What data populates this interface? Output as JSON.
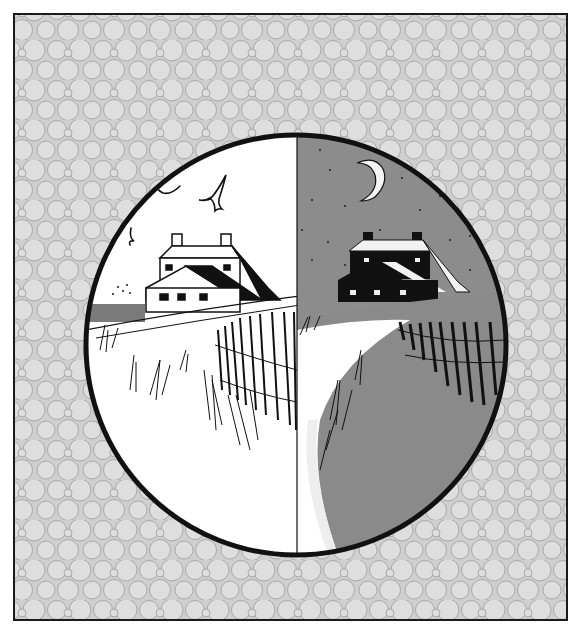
{
  "illustration": {
    "title": "Farmhouse by the dunes — day and night",
    "frame": {
      "x": 14,
      "y": 14,
      "width": 553,
      "height": 606,
      "border_color": "#1a1a1a"
    },
    "background_pattern": {
      "type": "packed-circles",
      "fill": "#dcdcdc",
      "stroke": "#a9a9a9"
    },
    "vignette": {
      "cx": 296,
      "cy": 345,
      "r": 210,
      "border_color": "#111111",
      "border_width": 5
    },
    "day_half": {
      "sky_color": "#ffffff",
      "elements": [
        "farmhouse",
        "three-birds",
        "grass-dunes",
        "sand-fence",
        "path"
      ]
    },
    "night_half": {
      "sky_color": "#8c8c8c",
      "elements": [
        "crescent-moon",
        "stars",
        "farmhouse",
        "grass-dunes",
        "sand-fence",
        "path"
      ]
    },
    "colors": {
      "ink": "#111111",
      "night": "#8a8a8a",
      "night_dark": "#6f6f6f",
      "day": "#ffffff",
      "snow": "#f2f2f2"
    }
  }
}
